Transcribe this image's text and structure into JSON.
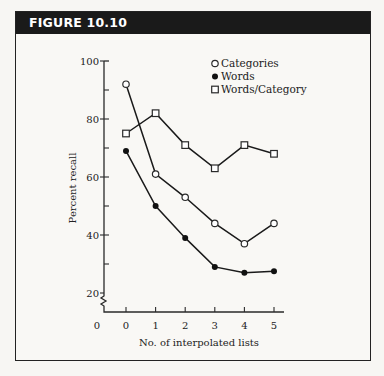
{
  "figure": {
    "label": "FIGURE 10.10"
  },
  "chart_data": {
    "type": "line",
    "title": "",
    "xlabel": "No. of interpolated lists",
    "ylabel": "Percent recall",
    "x": [
      0,
      1,
      2,
      3,
      4,
      5
    ],
    "x_tick_labels": [
      "0",
      "1",
      "2",
      "3",
      "4",
      "5"
    ],
    "origin_label": "0",
    "y_tick_labels": [
      "20",
      "40",
      "60",
      "80",
      "100"
    ],
    "ylim": [
      20,
      100
    ],
    "y_axis_break": true,
    "grid": false,
    "legend_position": "upper right",
    "series": [
      {
        "name": "Categories",
        "marker": "open-circle",
        "values": [
          92,
          61,
          53,
          44,
          37,
          44
        ]
      },
      {
        "name": "Words",
        "marker": "filled-circle",
        "values": [
          69,
          50,
          39,
          29,
          27,
          27.5
        ]
      },
      {
        "name": "Words/Category",
        "marker": "open-square",
        "values": [
          75,
          82,
          71,
          63,
          71,
          68
        ]
      }
    ]
  }
}
